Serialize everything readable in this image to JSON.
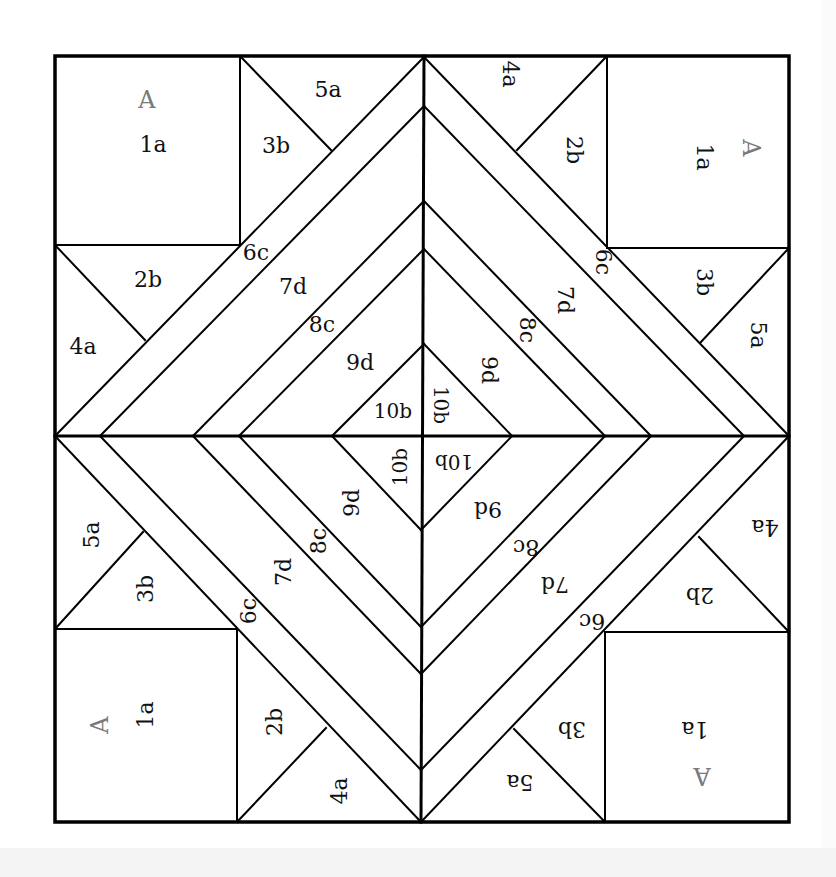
{
  "diagram": {
    "type": "quilt-foundation-paper-piecing-pattern",
    "colors": {
      "line": "#000000",
      "label": "#111111",
      "section_label": "#7a7a7a",
      "background": "#ffffff"
    },
    "quadrants": {
      "top_left": {
        "section": "A",
        "pieces": [
          "1a",
          "2b",
          "3b",
          "4a",
          "5a",
          "6c",
          "7d",
          "8c",
          "9d",
          "10b"
        ],
        "rotation": 0
      },
      "top_right": {
        "section": "A",
        "pieces": [
          "1a",
          "2b",
          "3b",
          "4a",
          "5a",
          "6c",
          "7d",
          "8c",
          "9d",
          "10b"
        ],
        "rotation": 90
      },
      "bottom_left": {
        "section": "A",
        "pieces": [
          "1a",
          "2b",
          "3b",
          "4a",
          "5a",
          "6c",
          "7d",
          "8c",
          "9d",
          "10b"
        ],
        "rotation": -90
      },
      "bottom_right": {
        "section": "A",
        "pieces": [
          "1a",
          "2b",
          "3b",
          "4a",
          "5a",
          "6c",
          "7d",
          "8c",
          "9d",
          "10b"
        ],
        "rotation": 180
      }
    },
    "labels": {
      "section": "A",
      "p1": "1a",
      "p2": "2b",
      "p3": "3b",
      "p4": "4a",
      "p5": "5a",
      "p6": "6c",
      "p7": "7d",
      "p8": "8c",
      "p9": "9d",
      "p10": "10b"
    }
  }
}
